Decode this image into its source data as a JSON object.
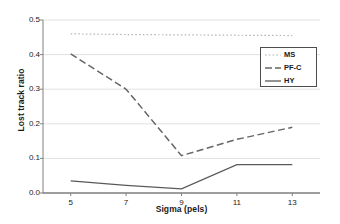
{
  "chart_data": {
    "type": "line",
    "title": "",
    "xlabel": "Sigma (pels)",
    "ylabel": "Lost track ratio",
    "x": [
      5,
      7,
      9,
      11,
      13
    ],
    "xticklabels": [
      "5",
      "7",
      "9",
      "11",
      "13"
    ],
    "yticklabels": [
      "0.0",
      "0.1",
      "0.2",
      "0.3",
      "0.4",
      "0.5"
    ],
    "yticks": [
      0.0,
      0.1,
      0.2,
      0.3,
      0.4,
      0.5
    ],
    "xlim": [
      4,
      14
    ],
    "ylim": [
      0.0,
      0.5
    ],
    "grid": "horizontal",
    "legend_position": "upper-right-inside",
    "series": [
      {
        "name": "MS",
        "style": "dotted",
        "color": "#b3b3b3",
        "values": [
          0.46,
          0.458,
          0.457,
          0.456,
          0.455
        ]
      },
      {
        "name": "PF-C",
        "style": "dashed",
        "color": "#666666",
        "values": [
          0.402,
          0.3,
          0.108,
          0.155,
          0.19
        ]
      },
      {
        "name": "HY",
        "style": "solid",
        "color": "#595959",
        "values": [
          0.035,
          0.022,
          0.012,
          0.082,
          0.082
        ]
      }
    ]
  },
  "legend": {
    "items": [
      {
        "label": "MS"
      },
      {
        "label": "PF-C"
      },
      {
        "label": "HY"
      }
    ]
  }
}
